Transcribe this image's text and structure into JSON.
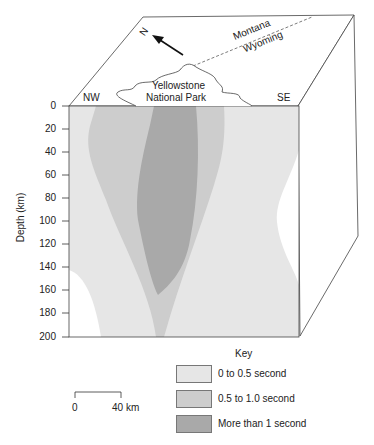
{
  "diagram": {
    "compass": {
      "label": "N",
      "icon": "north-arrow-icon"
    },
    "border_labels": [
      "Montana",
      "Wyoming"
    ],
    "park_label": [
      "Yellowstone",
      "National Park"
    ],
    "side_labels": {
      "left": "NW",
      "right": "SE"
    },
    "y_axis": {
      "label": "Depth (km)",
      "ticks": [
        "0",
        "20",
        "40",
        "60",
        "80",
        "100",
        "120",
        "140",
        "160",
        "180",
        "200"
      ]
    },
    "scale_bar": {
      "start": "0",
      "end": "40 km"
    },
    "key": {
      "title": "Key",
      "items": [
        {
          "label": "0 to 0.5 second",
          "color": "#e6e6e6"
        },
        {
          "label": "0.5 to 1.0 second",
          "color": "#cdcdcd"
        },
        {
          "label": "More than 1 second",
          "color": "#a9a9a9"
        }
      ]
    }
  }
}
